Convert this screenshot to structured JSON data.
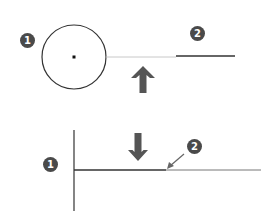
{
  "colors": {
    "background": "#ffffff",
    "badge_fill": "#4a4a4a",
    "badge_text": "#ffffff",
    "stroke_dark": "#333333",
    "stroke_light": "#bbbbbb",
    "arrow_fill": "#555555"
  },
  "top_panel": {
    "badges": [
      {
        "label": "1",
        "x": 27,
        "y": 40
      },
      {
        "label": "2",
        "x": 197,
        "y": 33
      }
    ],
    "circle": {
      "cx": 74,
      "cy": 57,
      "r": 32
    },
    "center_dot": {
      "cx": 74,
      "cy": 57
    },
    "faint_line": {
      "x1": 106,
      "x2": 176,
      "y": 57
    },
    "solid_line": {
      "x1": 176,
      "x2": 235,
      "y": 56
    },
    "arrow": {
      "direction": "up",
      "icon": "arrow-up-icon",
      "cx": 143
    }
  },
  "bottom_panel": {
    "badges": [
      {
        "label": "1",
        "x": 50,
        "y": 164
      },
      {
        "label": "2",
        "x": 194,
        "y": 146
      }
    ],
    "vertical_line": {
      "x": 74,
      "y1": 130,
      "y2": 211
    },
    "horizontal_line": {
      "x1": 74,
      "x2": 261,
      "y": 170
    },
    "arrow": {
      "direction": "down",
      "icon": "arrow-down-icon",
      "cx": 138
    },
    "pointer": {
      "icon": "pointer-arrow-icon",
      "from": [
        184,
        154
      ],
      "to": [
        167,
        169
      ]
    }
  }
}
